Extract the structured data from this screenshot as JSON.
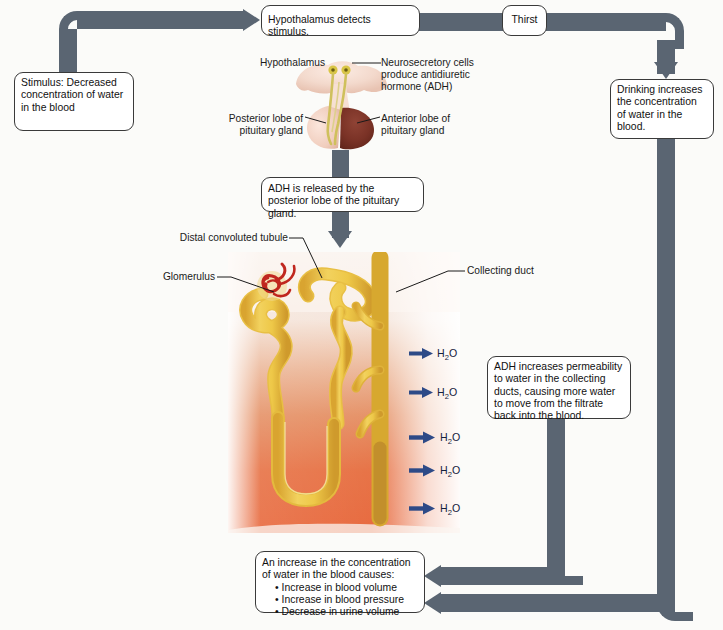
{
  "diagram": {
    "background_color": "#fbfbf9",
    "connector_color": "#5a6572",
    "box_border_color": "#3a3a3a",
    "h2o_arrow_color": "#2d4a87"
  },
  "boxes": {
    "stimulus": "Stimulus: Decreased concentration of water in the blood",
    "hypothalamus_detects": "Hypothalamus detects stimulus.",
    "thirst": "Thirst",
    "drinking": "Drinking increases the concentration of water in the blood.",
    "adh_released": "ADH is released by the posterior lobe of the pituitary gland.",
    "adh_permeability": "ADH increases permeability to water in the collecting ducts, causing more water to move from the filtrate back into the blood.",
    "result_heading": "An increase in the concentration of water in the blood causes:",
    "result_bullets": [
      "Increase in blood volume",
      "Increase in blood pressure",
      "Decrease in urine volume"
    ]
  },
  "pituitary_labels": {
    "hypothalamus": "Hypothalamus",
    "neurosecretory": "Neurosecretory cells produce antidiuretic hormone (ADH)",
    "posterior_lobe": "Posterior lobe of pituitary gland",
    "anterior_lobe": "Anterior lobe of pituitary gland"
  },
  "nephron_labels": {
    "distal_convoluted_tubule": "Distal convoluted tubule",
    "glomerulus": "Glomerulus",
    "collecting_duct": "Collecting duct"
  },
  "water_labels": {
    "formula": "H",
    "subscript": "2",
    "formula_tail": "O",
    "count": 5
  }
}
